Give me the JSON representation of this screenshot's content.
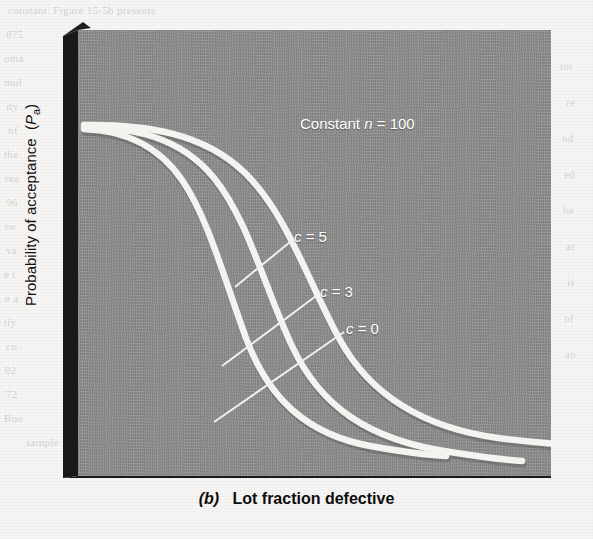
{
  "figure": {
    "caption_prefix": "(b)",
    "caption_text": "Lot fraction defective",
    "y_axis_label_main": "Probability of acceptance",
    "y_axis_label_symbol": "P",
    "y_axis_label_subscript": "a",
    "annotation_constant": "Constant",
    "annotation_symbol": "n",
    "annotation_equals": "= 100",
    "label_c5": "c = 5",
    "label_c3": "c = 3",
    "label_c0": "c = 0"
  },
  "colors": {
    "panel_gray": "#8c8c8c",
    "bevel_dark": "#1a1a1a",
    "curve_white": "#f2f2ee",
    "page_background": "#f6f5f3",
    "text_black": "#0d0d0d"
  },
  "bleed_through": [
    {
      "text": "constant. Figure 15-5b presents",
      "x": 8,
      "y": 4
    },
    {
      "text": "875",
      "x": 6,
      "y": 28
    },
    {
      "text": "oma",
      "x": 4,
      "y": 52
    },
    {
      "text": "mul",
      "x": 4,
      "y": 76
    },
    {
      "text": "ity",
      "x": 6,
      "y": 100
    },
    {
      "text": "nf",
      "x": 8,
      "y": 124
    },
    {
      "text": "the",
      "x": 4,
      "y": 148
    },
    {
      "text": "rea",
      "x": 5,
      "y": 172
    },
    {
      "text": "96",
      "x": 6,
      "y": 196
    },
    {
      "text": "tw",
      "x": 5,
      "y": 220
    },
    {
      "text": "va",
      "x": 6,
      "y": 244
    },
    {
      "text": "e t",
      "x": 4,
      "y": 268
    },
    {
      "text": "e a",
      "x": 5,
      "y": 292
    },
    {
      "text": "tly",
      "x": 4,
      "y": 316
    },
    {
      "text": "co",
      "x": 6,
      "y": 340
    },
    {
      "text": "02",
      "x": 5,
      "y": 364
    },
    {
      "text": "72",
      "x": 6,
      "y": 388
    },
    {
      "text": "Boo",
      "x": 4,
      "y": 412
    },
    {
      "text": "sample size from",
      "x": 26,
      "y": 436
    },
    {
      "text": "tot",
      "x": 560,
      "y": 60
    },
    {
      "text": "re",
      "x": 566,
      "y": 96
    },
    {
      "text": "nd",
      "x": 562,
      "y": 132
    },
    {
      "text": "ed",
      "x": 564,
      "y": 168
    },
    {
      "text": "he",
      "x": 563,
      "y": 204
    },
    {
      "text": "ar",
      "x": 566,
      "y": 240
    },
    {
      "text": "is",
      "x": 567,
      "y": 276
    },
    {
      "text": "of",
      "x": 564,
      "y": 312
    },
    {
      "text": "an",
      "x": 565,
      "y": 348
    }
  ],
  "chart_data": {
    "type": "line",
    "xlabel": "Lot fraction defective",
    "ylabel": "Probability of acceptance (Pa)",
    "annotation": "Constant n = 100",
    "grid": false,
    "legend": "inline-labels",
    "xlim": [
      0,
      1
    ],
    "ylim": [
      0,
      1
    ],
    "axis_ticks": "none",
    "series": [
      {
        "name": "c = 0",
        "label": "c = 0",
        "color": "#f2f2ee",
        "description": "Steepest operating characteristic curve; acceptance number zero.",
        "x": [
          0.0,
          0.04,
          0.08,
          0.12,
          0.16,
          0.22,
          0.28,
          0.34,
          0.42,
          0.5,
          0.58,
          0.68,
          0.78
        ],
        "y": [
          1.0,
          0.97,
          0.91,
          0.82,
          0.7,
          0.52,
          0.36,
          0.24,
          0.14,
          0.08,
          0.05,
          0.03,
          0.02
        ]
      },
      {
        "name": "c = 3",
        "label": "c = 3",
        "color": "#f2f2ee",
        "description": "Middle operating characteristic curve; acceptance number three.",
        "x": [
          0.0,
          0.06,
          0.12,
          0.18,
          0.24,
          0.32,
          0.4,
          0.48,
          0.58,
          0.68,
          0.78,
          0.88,
          0.95
        ],
        "y": [
          1.0,
          0.98,
          0.94,
          0.87,
          0.77,
          0.62,
          0.46,
          0.33,
          0.2,
          0.12,
          0.07,
          0.04,
          0.02
        ]
      },
      {
        "name": "c = 5",
        "label": "c = 5",
        "color": "#f2f2ee",
        "description": "Shallowest operating characteristic curve; acceptance number five.",
        "x": [
          0.0,
          0.08,
          0.16,
          0.24,
          0.32,
          0.4,
          0.5,
          0.6,
          0.7,
          0.8,
          0.9,
          0.98,
          1.0
        ],
        "y": [
          1.0,
          0.99,
          0.96,
          0.91,
          0.83,
          0.72,
          0.57,
          0.42,
          0.29,
          0.19,
          0.12,
          0.08,
          0.07
        ]
      }
    ]
  }
}
